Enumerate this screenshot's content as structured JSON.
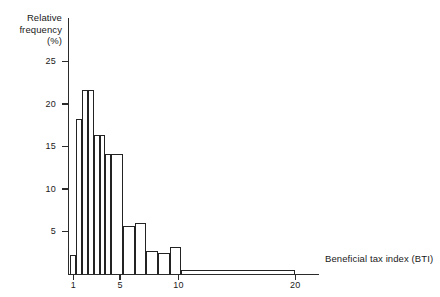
{
  "chart_data": {
    "type": "bar",
    "title": "",
    "subtitle": "",
    "xlabel": "Beneficial tax index (BTI)",
    "ylabel": "Relative frequency (%)",
    "ylabel_lines": [
      "Relative",
      "frequency",
      "(%)"
    ],
    "grid": false,
    "legend": false,
    "xlim": [
      0.6,
      21.0
    ],
    "ylim": [
      0,
      27
    ],
    "xticks": [
      1,
      5,
      10,
      20
    ],
    "xtick_labels": [
      "1",
      "5",
      "10",
      "20"
    ],
    "yticks": [
      5,
      10,
      15,
      20,
      25
    ],
    "ytick_labels": [
      "5",
      "10",
      "15",
      "20",
      "25"
    ],
    "bin_edges": [
      0.75,
      1.25,
      1.75,
      2.25,
      2.75,
      3.25,
      3.75,
      4.25,
      4.75,
      5.25,
      5.75,
      6.25,
      6.75,
      7.25,
      7.75,
      8.25,
      8.75,
      9.25,
      9.75,
      10.25,
      20.0
    ],
    "bars": [
      {
        "label": "0.75-1.25",
        "x0": 0.75,
        "x1": 1.25,
        "value": 2.2
      },
      {
        "label": "1.25-1.75",
        "x0": 1.25,
        "x1": 1.75,
        "value": 18.2
      },
      {
        "label": "1.75-2.25",
        "x0": 1.75,
        "x1": 2.25,
        "value": 21.6
      },
      {
        "label": "2.25-2.75",
        "x0": 2.25,
        "x1": 2.75,
        "value": 21.6
      },
      {
        "label": "2.75-3.25",
        "x0": 2.75,
        "x1": 3.25,
        "value": 16.4
      },
      {
        "label": "3.25-3.75",
        "x0": 3.25,
        "x1": 3.75,
        "value": 16.4
      },
      {
        "label": "3.75-4.25",
        "x0": 3.75,
        "x1": 4.25,
        "value": 14.1
      },
      {
        "label": "4.25-5.25",
        "x0": 4.25,
        "x1": 5.25,
        "value": 14.1
      },
      {
        "label": "5.25-6.25",
        "x0": 5.25,
        "x1": 6.25,
        "value": 5.7
      },
      {
        "label": "6.25-7.25",
        "x0": 6.25,
        "x1": 7.25,
        "value": 6.0
      },
      {
        "label": "7.25-8.25",
        "x0": 7.25,
        "x1": 8.25,
        "value": 2.7
      },
      {
        "label": "8.25-9.25",
        "x0": 8.25,
        "x1": 9.25,
        "value": 2.5
      },
      {
        "label": "9.25-10.25",
        "x0": 9.25,
        "x1": 10.25,
        "value": 3.2
      },
      {
        "label": "10.25-20",
        "x0": 10.25,
        "x1": 20.0,
        "value": 0.45
      }
    ],
    "categories": [
      "0.75-1.25",
      "1.25-1.75",
      "1.75-2.25",
      "2.25-2.75",
      "2.75-3.25",
      "3.25-3.75",
      "3.75-4.25",
      "4.25-5.25",
      "5.25-6.25",
      "6.25-7.25",
      "7.25-8.25",
      "8.25-9.25",
      "9.25-10.25",
      "10.25-20"
    ],
    "values": [
      2.2,
      18.2,
      21.6,
      21.6,
      16.4,
      16.4,
      14.1,
      14.1,
      5.7,
      6.0,
      2.7,
      2.5,
      3.2,
      0.45
    ],
    "colors": {
      "bar_fill": "#ffffff",
      "bar_stroke": "#232323",
      "axis": "#2b2b2b",
      "text": "#1a1a1a"
    }
  }
}
